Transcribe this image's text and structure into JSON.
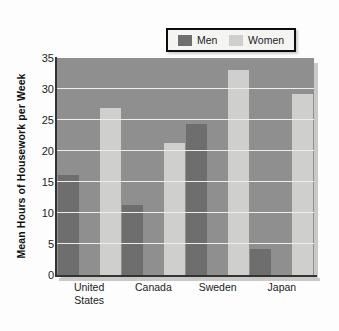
{
  "chart_data": {
    "type": "bar",
    "title": "",
    "subtitle": "",
    "xlabel": "",
    "ylabel": "Mean Hours of Housework per Week",
    "categories": [
      "United States",
      "Canada",
      "Sweden",
      "Japan"
    ],
    "category_display": [
      "United\nStates",
      "Canada",
      "Sweden",
      "Japan"
    ],
    "series": [
      {
        "name": "Men",
        "color": "#6e6e6e",
        "values": [
          16.2,
          11.3,
          24.3,
          4.2
        ]
      },
      {
        "name": "Women",
        "color": "#cfcfcd",
        "values": [
          27.0,
          21.3,
          33.0,
          29.2
        ]
      }
    ],
    "ylim": [
      0,
      35
    ],
    "yticks": [
      0,
      5,
      10,
      15,
      20,
      25,
      30,
      35
    ],
    "ytick_labels": [
      "0",
      "5",
      "10",
      "15",
      "20",
      "25",
      "30",
      "35"
    ],
    "grid": true,
    "grid_orientation": "horizontal",
    "grid_color": "#ededeb",
    "legend_position": "top-center",
    "plot_background": "#8f8f8f",
    "page_background": "#fdfdfd"
  },
  "legend": {
    "entries": [
      {
        "label": "Men",
        "color": "#6e6e6e"
      },
      {
        "label": "Women",
        "color": "#cfcfcd"
      }
    ],
    "border_color": "#0d0d0d",
    "background": "#f4f4f2"
  }
}
